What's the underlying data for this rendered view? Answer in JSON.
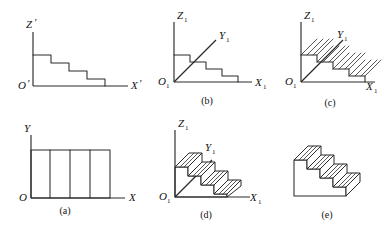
{
  "figure": {
    "background_color": "#ffffff",
    "line_color": "#2b2b2b",
    "width": 390,
    "height": 240
  },
  "panels": [
    {
      "id": "top-left",
      "caption": "",
      "description": "Elevation: descending four-step profile in primed coordinate system",
      "axes": {
        "vertical_label": "Z",
        "vertical_prime": "′",
        "horizontal_label": "X",
        "horizontal_prime": "′",
        "origin_label": "O",
        "origin_prime": "′"
      },
      "steps": 4
    },
    {
      "id": "b",
      "caption": "(b)",
      "description": "Elevation with oblique Y axis drawn through the step profile",
      "axes": {
        "vertical_label": "Z",
        "vertical_sub": "1",
        "horizontal_label": "X",
        "horizontal_sub": "1",
        "oblique_label": "Y",
        "oblique_sub": "1",
        "origin_label": "O",
        "origin_sub": "1"
      },
      "steps": 4
    },
    {
      "id": "c",
      "caption": "(c)",
      "description": "Step profile with projection rays hatched along the Y axis direction",
      "axes": {
        "vertical_label": "Z",
        "vertical_sub": "1",
        "horizontal_label": "X",
        "horizontal_sub": "1",
        "oblique_label": "Y",
        "oblique_sub": "1",
        "origin_label": "O",
        "origin_sub": "1"
      },
      "steps": 4,
      "ray_count": 16
    },
    {
      "id": "a",
      "caption": "(a)",
      "description": "Plan view: rectangle divided into four equal bays",
      "axes": {
        "vertical_label": "Y",
        "horizontal_label": "X",
        "origin_label": "O"
      },
      "divisions": 4
    },
    {
      "id": "d",
      "caption": "(d)",
      "description": "Oblique pictorial of the staircase solid located on the axes",
      "axes": {
        "vertical_label": "Z",
        "vertical_sub": "1",
        "horizontal_label": "X",
        "horizontal_sub": "1",
        "oblique_label": "Y",
        "oblique_sub": "1",
        "origin_label": "O",
        "origin_sub": "1"
      },
      "steps": 4
    },
    {
      "id": "e",
      "caption": "(e)",
      "description": "Completed staircase solid shown without construction axes",
      "steps": 4
    }
  ]
}
